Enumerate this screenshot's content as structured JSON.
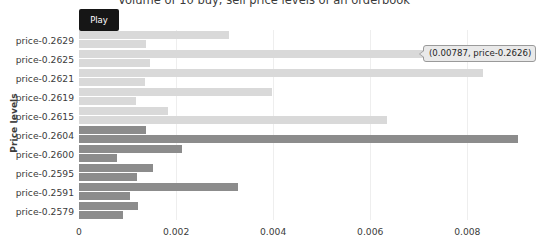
{
  "chart_data": {
    "type": "bar",
    "title": "Volume of 10 buy, sell price levels of an orderbook",
    "xlabel": "",
    "ylabel": "Price levels",
    "orientation": "horizontal",
    "grid": true,
    "legend": "none",
    "xlim": [
      0,
      0.00925
    ],
    "xticks": [
      0,
      0.002,
      0.004,
      0.006,
      0.008
    ],
    "xtick_labels": [
      "0",
      "0.002",
      "0.004",
      "0.006",
      "0.008"
    ],
    "categories": [
      "price-0.2629",
      "price-0.2625",
      "price-0.2621",
      "price-0.2619",
      "price-0.2615",
      "price-0.2604",
      "price-0.2600",
      "price-0.2595",
      "price-0.2591",
      "price-0.2579"
    ],
    "series": [
      {
        "name": "sell",
        "color": "#d9d9d9",
        "values": [
          0.0031,
          0.00787,
          0.00832,
          0.00398,
          0.00184,
          0.00139,
          0.00213,
          0.00152,
          0.00328,
          0.00121
        ]
      },
      {
        "name": "buy",
        "color": "#8c8c8c",
        "values": [
          0.00137,
          0.00147,
          0.00135,
          0.00117,
          0.00635,
          0.00905,
          0.00078,
          0.0012,
          0.00105,
          0.00091
        ]
      }
    ],
    "annotations": [
      {
        "name": "hover-tooltip",
        "text": "(0.00787, price-0.2626)",
        "x": 0.00787,
        "y": "price-0.2626"
      }
    ]
  },
  "controls": {
    "play_label": "Play"
  }
}
